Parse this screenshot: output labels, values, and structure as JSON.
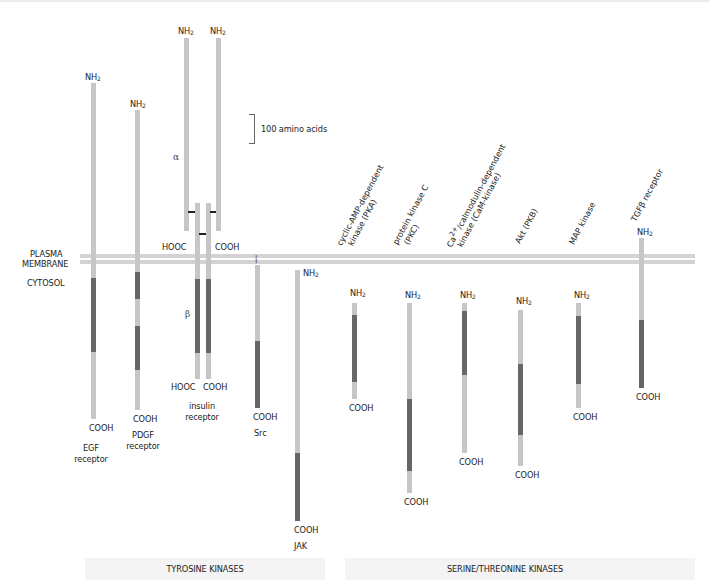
{
  "diagram": {
    "scale_bar": {
      "label": "100 amino acids"
    },
    "compartments": {
      "membrane_line1": "PLASMA",
      "membrane_line2": "MEMBRANE",
      "cytosol": "CYTOSOL"
    },
    "group_labels": {
      "tyrosine": "TYROSINE KINASES",
      "serine_threonine": "SERINE/THREONINE KINASES"
    },
    "termini": {
      "nh2": "NH",
      "nh2_sub": "2",
      "cooh": "COOH",
      "hooc": "HOOC"
    },
    "chain_labels": {
      "alpha": "α",
      "beta": "β"
    },
    "colors": {
      "domain_light": "#c6c6c6",
      "kinase_domain_dark": "#666666",
      "membrane": "#d3d3d3"
    },
    "proteins": [
      {
        "name_line1": "EGF",
        "name_line2": "receptor",
        "group": "tyrosine"
      },
      {
        "name_line1": "PDGF",
        "name_line2": "receptor",
        "group": "tyrosine"
      },
      {
        "name_line1": "insulin",
        "name_line2": "receptor",
        "group": "tyrosine"
      },
      {
        "name_line1": "Src",
        "group": "tyrosine"
      },
      {
        "name_line1": "JAK",
        "group": "tyrosine"
      },
      {
        "name_line1": "cyclic-AMP-dependent",
        "name_line2": "kinase (PKA)",
        "group": "serine_threonine"
      },
      {
        "name_line1": "protein kinase C",
        "name_line2": "(PKC)",
        "group": "serine_threonine"
      },
      {
        "name_line1_pre": "Ca",
        "name_line1_sup": "2+",
        "name_line1_post": "/calmodulin-dependent",
        "name_line2": "kinase (CaM-kinase)",
        "group": "serine_threonine"
      },
      {
        "name_line1": "Akt (PKB)",
        "group": "serine_threonine"
      },
      {
        "name_line1": "MAP kinase",
        "group": "serine_threonine"
      },
      {
        "name_line1": "TGFβ receptor",
        "group": "serine_threonine"
      }
    ]
  }
}
